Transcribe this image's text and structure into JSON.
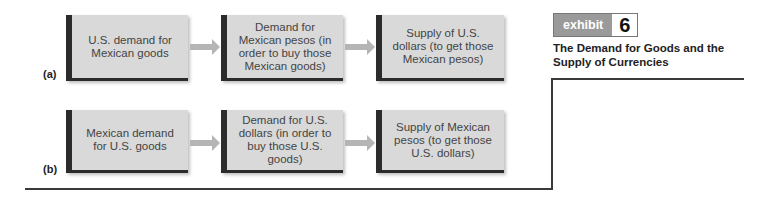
{
  "exhibit": {
    "word": "exhibit",
    "number": "6",
    "title": "The Demand for Goods and the Supply of Currencies"
  },
  "panels": [
    {
      "label": "(a)",
      "boxes": [
        "U.S. demand for Mexican goods",
        "Demand for Mexican pesos (in order to buy those Mexican goods)",
        "Supply of U.S. dollars (to get those Mexican pesos)"
      ]
    },
    {
      "label": "(b)",
      "boxes": [
        "Mexican demand for U.S. goods",
        "Demand for U.S. dollars (in order to buy those U.S. goods)",
        "Supply of Mexican pesos (to get those U.S. dollars)"
      ]
    }
  ],
  "colors": {
    "box_fill": "#d9d9d9",
    "box_border": "#2b2b2b",
    "arrow": "#b0b0b0",
    "exhibit_badge": "#9a9a9a"
  }
}
